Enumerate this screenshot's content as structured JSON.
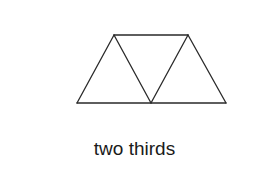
{
  "figure": {
    "shape": "trapezoid divided into three equilateral triangles",
    "triangle_count": 3,
    "caption": "two thirds",
    "line_color": "#2a2a2a"
  }
}
